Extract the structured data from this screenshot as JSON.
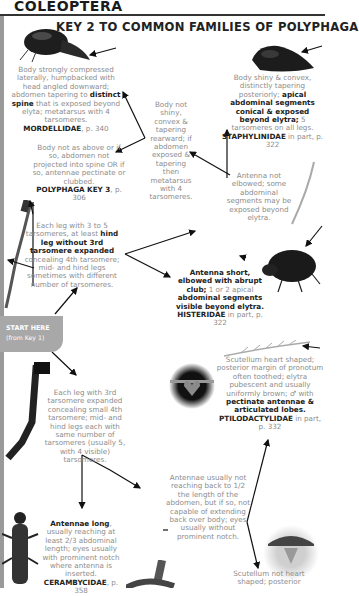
{
  "header": {
    "section_title": "COLEOPTERA",
    "key_title": "KEY 2 TO COMMON FAMILIES OF POLYPHAGA"
  },
  "start": {
    "label": "START HERE",
    "sub": "(from Key 1)"
  },
  "nodes": {
    "mordellidae": {
      "text_a": "Body strongly compressed laterally, humpbacked with head angled downward; abdomen tapering to ",
      "bold_a": "distinct spine",
      "text_b": " that is exposed beyond elyta; metatarsus with 4 tarsomeres.",
      "family": "MORDELLIDAE",
      "page": ", p. 340"
    },
    "staphylinidae": {
      "text_a": "Body shiny & convex, distinctly tapering posteriorly; ",
      "bold_a": "apical abdominal segments conical & exposed beyond elytra;",
      "text_b": " 5 tarsomeres on all legs.",
      "family": "STAPHYLINIDAE",
      "page": " in part, p. 322"
    },
    "body_not_shiny": {
      "text": "Body not shiny, convex & tapering rearward; if abdomen exposed & tapering then metatarsus with 4 tarsomeres."
    },
    "polyphaga_key3": {
      "text": "Body not as above or if so, abdomen not projected into spine OR if so, antennae pectinate or clubbed.",
      "family": "POLYPHAGA KEY 3",
      "page": ", p. 306"
    },
    "antenna_not_elbowed": {
      "text": "Antenna not elbowed; some abdominal segments may be exposed beyond elytra."
    },
    "leg_3to5": {
      "text_a": "Each leg with 3 to 5 tarsomeres, at least ",
      "bold_a": "hind leg without 3rd tarsomere expanded",
      "text_b": " concealing 4th tarsomere; mid- and hind legs sometimes with different number of tarsomeres."
    },
    "histeridae": {
      "bold_a": "Antenna short, elbowed with abrupt club;",
      "text_a": " 1 or 2 apical ",
      "bold_b": "abdominal segments visible beyond elytra.",
      "family": "HISTERIDAE",
      "page": " in part, p. 322"
    },
    "ptilodactylidae": {
      "text_a": "Scutellum heart shaped; posterior margin of pronotum often toothed; elytra pubescent and usually uniformly brown; ♂ with ",
      "bold_a": "pectinate antennae & articulated lobes.",
      "family": "PTILODACTYLIDAE",
      "page": " in part, p. 332"
    },
    "leg_3rd_expanded": {
      "text": "Each leg with 3rd tarsomere expanded concealing small 4th tarsomere; mid- and hind legs each with same number of tarsomeres (usually 5, with 4 visible) tarsomeres."
    },
    "antennae_short": {
      "text": "Antennae usually not reaching back to 1/2 the length of the abdomen, but if so, not capable of extending back over body; eyes usually without prominent notch."
    },
    "cerambycidae": {
      "bold_a": "Antennae long",
      "text_a": ", usually reaching at least 2/3 abdominal length; eyes usually with prominent notch where antenna is inserted.",
      "family": "CERAMBYCIDAE",
      "page": ", p. 358"
    },
    "scutellum_not_heart": {
      "text": "Scutellum not heart shaped; posterior"
    }
  }
}
